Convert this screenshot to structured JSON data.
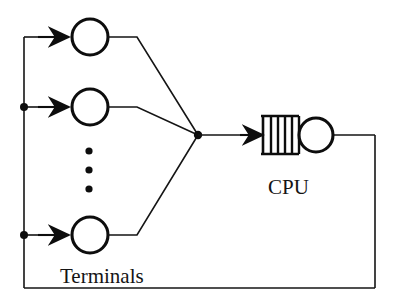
{
  "diagram": {
    "type": "queueing-network-diagram",
    "background_color": "#ffffff",
    "line_color": "#151515",
    "thick_line_color": "#0d0d0d",
    "labels": {
      "terminals": "Terminals",
      "cpu": "CPU"
    },
    "terminals": {
      "count_shown": 3,
      "ellipsis_dots": 3,
      "circle_radius": 18,
      "nodes": [
        {
          "name": "terminal-top",
          "cx": 90,
          "cy": 37,
          "arrow_from_x": 38,
          "arrow_to_x": 69
        },
        {
          "name": "terminal-middle",
          "cx": 90,
          "cy": 107,
          "arrow_from_x": 38,
          "arrow_to_x": 69
        },
        {
          "name": "terminal-bottom",
          "cx": 90,
          "cy": 235,
          "arrow_from_x": 38,
          "arrow_to_x": 69
        }
      ],
      "ellipsis": [
        {
          "cx": 89,
          "cy": 151
        },
        {
          "cx": 89,
          "cy": 170
        },
        {
          "cx": 89,
          "cy": 189
        }
      ]
    },
    "junction": {
      "name": "merge-point",
      "cx": 198,
      "cy": 135,
      "r": 4
    },
    "branch_dots": [
      {
        "name": "branch-dot-middle",
        "cx": 24,
        "cy": 107,
        "r": 4
      },
      {
        "name": "branch-dot-bottom",
        "cx": 24,
        "cy": 235,
        "r": 4
      }
    ],
    "feedback_path": {
      "left_x": 24,
      "top_y": 37,
      "bottom_y": 288,
      "right_x": 375,
      "cpu_exit_y": 135
    },
    "queue": {
      "name": "cpu-queue",
      "x": 263,
      "y": 116,
      "width": 35,
      "height": 38,
      "slot_dividers": 4,
      "arrow_from_x": 240,
      "arrow_to_x": 262
    },
    "server": {
      "name": "cpu-server",
      "cx": 316,
      "cy": 135,
      "r": 17
    },
    "label_positions": {
      "terminals": {
        "x": 60,
        "y": 283,
        "font_size": 21
      },
      "cpu": {
        "x": 268,
        "y": 194,
        "font_size": 21
      }
    }
  }
}
